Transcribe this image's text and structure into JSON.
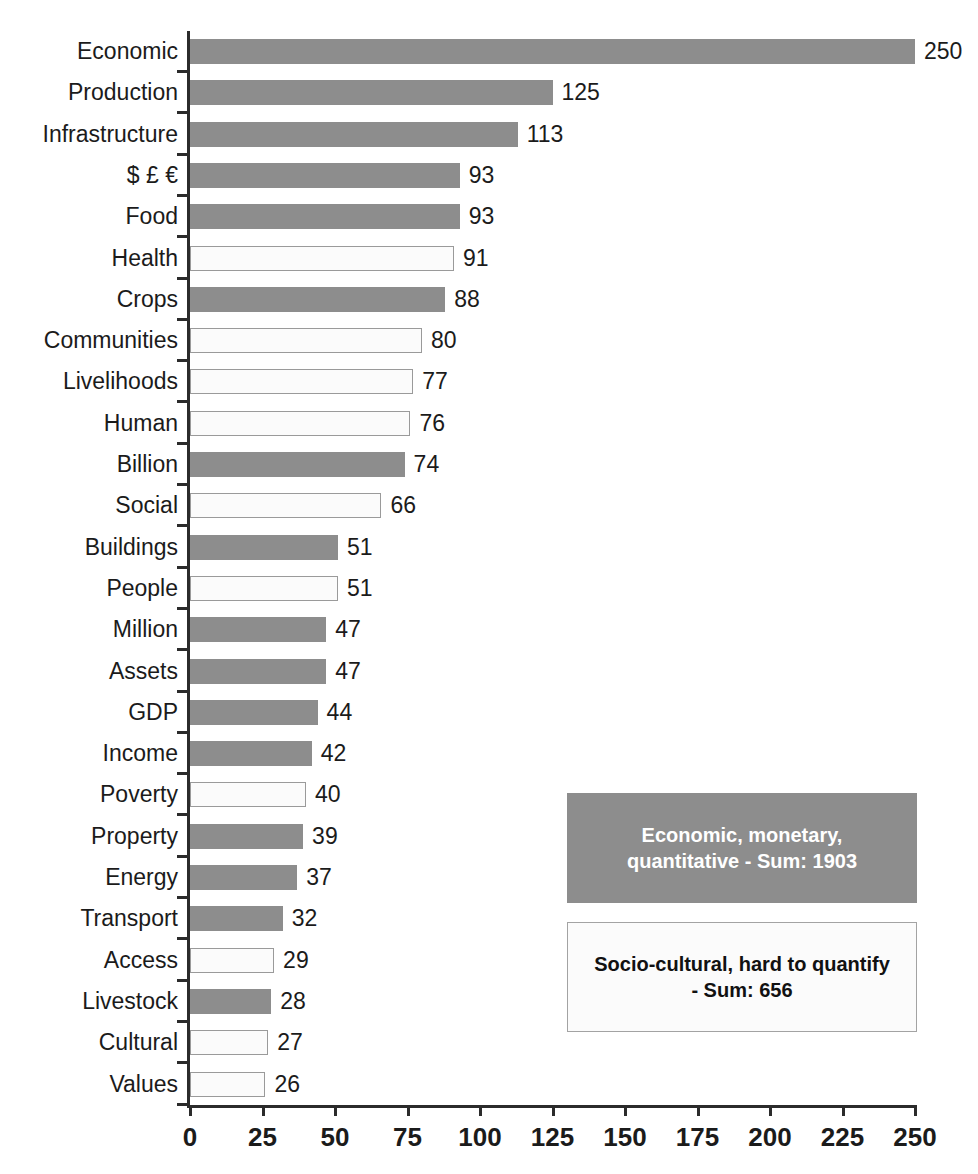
{
  "chart_data": {
    "type": "bar",
    "orientation": "horizontal",
    "title": "",
    "xlabel": "",
    "ylabel": "",
    "xlim": [
      0,
      250
    ],
    "xticks": [
      "0",
      "25",
      "50",
      "75",
      "100",
      "125",
      "150",
      "175",
      "200",
      "225",
      "250"
    ],
    "xtick_values": [
      0,
      25,
      50,
      75,
      100,
      125,
      150,
      175,
      200,
      225,
      250
    ],
    "grid": false,
    "categories": [
      "Economic",
      "Production",
      "Infrastructure",
      "$ £ €",
      "Food",
      "Health",
      "Crops",
      "Communities",
      "Livelihoods",
      "Human",
      "Billion",
      "Social",
      "Buildings",
      "People",
      "Million",
      "Assets",
      "GDP",
      "Income",
      "Poverty",
      "Property",
      "Energy",
      "Transport",
      "Access",
      "Livestock",
      "Cultural",
      "Values"
    ],
    "values": [
      250,
      125,
      113,
      93,
      93,
      91,
      88,
      80,
      77,
      76,
      74,
      66,
      51,
      51,
      47,
      47,
      44,
      42,
      40,
      39,
      37,
      32,
      29,
      28,
      27,
      26
    ],
    "value_labels": [
      "250",
      "125",
      "113",
      "93",
      "93",
      "91",
      "88",
      "80",
      "77",
      "76",
      "74",
      "66",
      "51",
      "51",
      "47",
      "47",
      "44",
      "42",
      "40",
      "39",
      "37",
      "32",
      "29",
      "28",
      "27",
      "26"
    ],
    "group": [
      "economic",
      "economic",
      "economic",
      "economic",
      "economic",
      "socio",
      "economic",
      "socio",
      "socio",
      "socio",
      "economic",
      "socio",
      "economic",
      "socio",
      "economic",
      "economic",
      "economic",
      "economic",
      "socio",
      "economic",
      "economic",
      "economic",
      "socio",
      "economic",
      "socio",
      "socio"
    ],
    "series": [
      {
        "name": "Economic, monetary, quantitative",
        "style": "filled",
        "color": "#8d8d8d",
        "sum": 1903
      },
      {
        "name": "Socio-cultural, hard to quantify",
        "style": "hollow",
        "color": "#fbfbfb",
        "border_color": "#9a9a9a",
        "sum": 656
      }
    ],
    "legend": {
      "position": "inside-lower-right",
      "entries": [
        {
          "label": "Economic, monetary, quantitative - Sum: 1903",
          "line1": "Economic, monetary,",
          "line2": "quantitative - Sum: 1903",
          "style": "filled"
        },
        {
          "label": "Socio-cultural, hard to quantify - Sum: 656",
          "line1": "Socio-cultural, hard to quantify",
          "line2": "- Sum: 656",
          "style": "hollow"
        }
      ]
    }
  },
  "colors": {
    "bar_filled": "#8d8d8d",
    "bar_hollow_fill": "#fbfbfb",
    "bar_hollow_border": "#9a9a9a",
    "axis": "#2b2b2b",
    "text": "#1b1b1b",
    "legend_filled_text": "#ffffff"
  }
}
